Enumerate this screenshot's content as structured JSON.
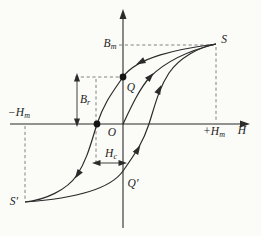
{
  "figure": {
    "name": "magnetic hysteresis loop (B-H curve)",
    "colors": {
      "ink": "#2b2b2b",
      "paper": "#fbfbf8",
      "dashed": "#666666"
    },
    "axis_labels": {
      "x": "H",
      "x_max": {
        "main": "+H",
        "sub": "m"
      },
      "x_min": {
        "main": "−H",
        "sub": "m"
      },
      "y_max": {
        "main": "B",
        "sub": "m"
      }
    },
    "point_labels": {
      "origin": "O",
      "saturation_pos": "S",
      "saturation_neg": "S′",
      "remanence_pos": "Q",
      "remanence_neg": "Q′"
    },
    "measure_labels": {
      "remanence": {
        "main": "B",
        "sub": "r"
      },
      "coercivity": {
        "main": "H",
        "sub": "c"
      }
    },
    "curves": [
      {
        "name": "descending-branch",
        "from": "S",
        "to": "S′",
        "through": [
          "Q",
          "coercivity-point"
        ],
        "arrow_direction": "toward S′"
      },
      {
        "name": "ascending-branch",
        "from": "S′",
        "to": "S",
        "through": [
          "Q′",
          "+Hc crossing"
        ],
        "arrow_direction": "toward S"
      },
      {
        "name": "initial-magnetization",
        "from": "O",
        "to": "S",
        "arrow_direction": "toward S"
      }
    ],
    "marked_points": [
      {
        "name": "remanence-dot",
        "on": "B-axis at Q"
      },
      {
        "name": "coercivity-dot",
        "on": "H-axis left of O"
      }
    ]
  }
}
